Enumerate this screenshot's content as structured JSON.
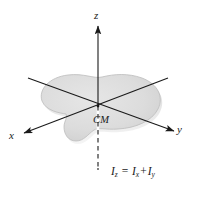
{
  "figure": {
    "background_color": "#ffffff"
  },
  "axes": {
    "z": {
      "label": "z",
      "icon": "arrow-up-icon",
      "color": "#1a1a1a"
    },
    "x": {
      "label": "x",
      "icon": "arrow-down-left-icon",
      "color": "#1a1a1a"
    },
    "y": {
      "label": "y",
      "icon": "arrow-down-right-icon",
      "color": "#1a1a1a"
    }
  },
  "lamina": {
    "name": "planar-lamina",
    "fill_color": "#dcdcdc",
    "edge_color": "#b8b8b8",
    "shadow_color": "#c4c4c4"
  },
  "center_of_mass": {
    "label": "CM",
    "marker": "vertical-dashed-line"
  },
  "equation": {
    "lhs": "I",
    "lhs_sub": "z",
    "equals": "=",
    "term1": "I",
    "term1_sub": "x",
    "plus": "+",
    "term2": "I",
    "term2_sub": "y",
    "plain": "I_z = I_x + I_y"
  }
}
